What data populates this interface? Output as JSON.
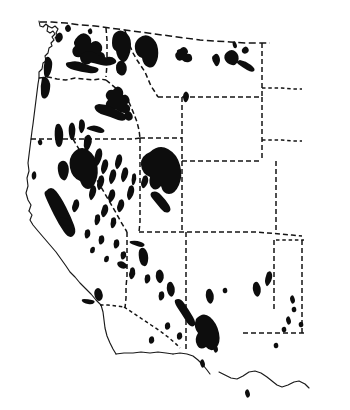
{
  "figure": {
    "kind": "distribution-map",
    "region": "Western United States",
    "title": "",
    "caption": "",
    "background_color": "#ffffff",
    "ink_color": "#0d0d0d",
    "outline_color": "#1a1a1a"
  },
  "legend": {
    "symbol_label": "shaded range area",
    "symbol_color": "#0d0d0d"
  },
  "map_data": {
    "type": "map",
    "projection": "unspecified",
    "boundary_style": {
      "coastline": "solid",
      "state_border": "dashed",
      "international_border": "dashed"
    },
    "states_outlined": [
      "Washington",
      "Oregon",
      "California",
      "Idaho",
      "Nevada",
      "Utah",
      "Arizona",
      "Montana",
      "Wyoming",
      "Colorado",
      "New Mexico"
    ],
    "shaded_clusters": [
      {
        "name": "olympic-coast-range",
        "state": "Washington",
        "density": "moderate"
      },
      {
        "name": "north-cascades",
        "state": "Washington",
        "density": "heavy"
      },
      {
        "name": "oregon-coast-range",
        "state": "Oregon",
        "density": "moderate"
      },
      {
        "name": "blue-mountains",
        "state": "Oregon",
        "density": "moderate"
      },
      {
        "name": "northern-rockies",
        "state": "Idaho",
        "density": "heavy"
      },
      {
        "name": "bitterroot-montana",
        "state": "Montana",
        "density": "heavy"
      },
      {
        "name": "central-montana-ranges",
        "state": "Montana",
        "density": "light"
      },
      {
        "name": "eastern-montana-outliers",
        "state": "Montana",
        "density": "light"
      },
      {
        "name": "sierra-nevada",
        "state": "California",
        "density": "heavy"
      },
      {
        "name": "great-basin-ranges",
        "state": "Nevada",
        "density": "scattered"
      },
      {
        "name": "wasatch-uinta",
        "state": "Utah",
        "density": "heavy"
      },
      {
        "name": "arizona-mogollon-rim",
        "state": "Arizona",
        "density": "scattered"
      },
      {
        "name": "southern-arizona-sky-islands",
        "state": "Arizona",
        "density": "scattered"
      },
      {
        "name": "new-mexico-southwest",
        "state": "New Mexico",
        "density": "moderate"
      },
      {
        "name": "new-mexico-outliers",
        "state": "New Mexico",
        "density": "light"
      }
    ],
    "unshaded_states": [
      "Colorado",
      "Wyoming"
    ]
  }
}
